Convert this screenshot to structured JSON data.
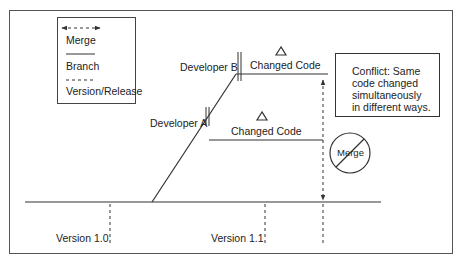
{
  "legend": {
    "items": [
      {
        "symbol": "dashed-double-arrow",
        "label": "Merge"
      },
      {
        "symbol": "solid-line",
        "label": "Branch"
      },
      {
        "symbol": "dashed-line",
        "label": "Version/Release"
      }
    ]
  },
  "developers": {
    "a": {
      "label": "Developer A",
      "change_label": "Changed Code",
      "delta": "Δ"
    },
    "b": {
      "label": "Developer B",
      "change_label": "Changed Code",
      "delta": "Δ"
    }
  },
  "conflict": {
    "lines": [
      "Conflict: Same",
      "code changed",
      "simultaneously",
      "in different ways."
    ]
  },
  "merge_blocked": {
    "label": "Merge"
  },
  "versions": [
    {
      "label": "Version 1.0"
    },
    {
      "label": "Version 1.1"
    }
  ],
  "colors": {
    "stroke": "#333333",
    "background": "#ffffff"
  }
}
